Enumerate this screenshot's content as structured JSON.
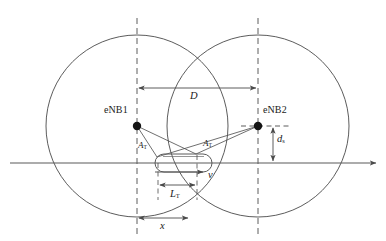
{
  "figure": {
    "type": "technical-diagram",
    "width": 386,
    "height": 241,
    "background_color": "#ffffff",
    "line_color": "#4a4a4a",
    "text_color": "#1a1a1a"
  },
  "nodes": [
    {
      "id": "enb1",
      "label": "eNB1",
      "x": 137,
      "y": 126,
      "label_x": 105,
      "label_y": 110
    },
    {
      "id": "enb2",
      "label": "eNB2",
      "x": 258,
      "y": 126,
      "label_x": 262,
      "label_y": 110
    }
  ],
  "coverage_circles": [
    {
      "id": "cell1",
      "center_x": 137,
      "center_y": 126,
      "radius": 91
    },
    {
      "id": "cell2",
      "center_x": 258,
      "center_y": 126,
      "radius": 91
    }
  ],
  "guide_lines": [
    {
      "id": "enb1-vertical",
      "x": 137,
      "y1": 18,
      "y2": 235,
      "style": "dashed"
    },
    {
      "id": "enb2-vertical",
      "x": 258,
      "y1": 18,
      "y2": 235,
      "style": "dashed"
    },
    {
      "id": "enb2-horizontal",
      "y": 126,
      "x1": 241,
      "x2": 292,
      "style": "dashed"
    },
    {
      "id": "train-front-vertical",
      "x": 197,
      "y1": 155,
      "y2": 200,
      "style": "dashed"
    },
    {
      "id": "train-rear-vertical",
      "x": 158,
      "y1": 163,
      "y2": 200,
      "style": "dashed"
    }
  ],
  "track": {
    "id": "railway-track",
    "y": 163,
    "x_start": 10,
    "x_end": 378,
    "has_arrow": true
  },
  "train": {
    "id": "train-body",
    "x": 155,
    "y": 154,
    "width": 57,
    "height": 18
  },
  "dimensions": [
    {
      "id": "inter-site-distance",
      "label": "D",
      "label_sub": "",
      "orientation": "horizontal",
      "y": 88,
      "x1": 137,
      "x2": 258,
      "label_x": 192,
      "label_y": 91
    },
    {
      "id": "track-offset",
      "label": "d",
      "label_sub": "s",
      "orientation": "vertical",
      "x": 273,
      "y1": 126,
      "y2": 163,
      "label_x": 277,
      "label_y": 139
    },
    {
      "id": "train-length",
      "label": "L",
      "label_sub": "T",
      "orientation": "horizontal",
      "y": 185,
      "x1": 158,
      "x2": 197,
      "label_x": 170,
      "label_y": 189
    },
    {
      "id": "train-position",
      "label": "x",
      "label_sub": "",
      "orientation": "horizontal",
      "y": 218,
      "x1": 137,
      "x2": 190,
      "label_x": 161,
      "label_y": 222
    }
  ],
  "angle_labels": [
    {
      "id": "angle-rear",
      "label": "A",
      "label_sub": "T",
      "x": 139,
      "y": 144
    },
    {
      "id": "angle-front",
      "label": "A",
      "label_sub": "T",
      "x": 203,
      "y": 142
    }
  ],
  "velocity": {
    "id": "velocity-vector",
    "label": "v",
    "y": 172,
    "x1": 155,
    "x2": 205,
    "label_x": 209,
    "label_y": 172
  },
  "signal_rays": [
    {
      "id": "ray-enb1-rear",
      "x1": 137,
      "y1": 126,
      "x2": 157,
      "y2": 157
    },
    {
      "id": "ray-enb1-front",
      "x1": 137,
      "y1": 126,
      "x2": 196,
      "y2": 154
    },
    {
      "id": "ray-enb2-rear",
      "x1": 258,
      "y1": 126,
      "x2": 157,
      "y2": 157
    },
    {
      "id": "ray-enb2-front",
      "x1": 258,
      "y1": 126,
      "x2": 196,
      "y2": 154
    }
  ]
}
